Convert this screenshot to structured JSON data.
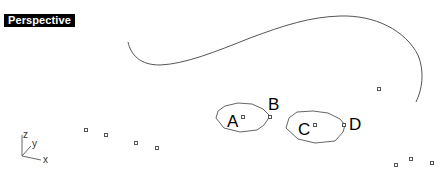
{
  "viewport": {
    "title": "Perspective",
    "axes": {
      "z": "z",
      "y": "y",
      "x": "x"
    },
    "labels": {
      "a": "A",
      "b": "B",
      "c": "C",
      "d": "D"
    },
    "colors": {
      "curve": "#555555",
      "title_bg": "#000000",
      "title_fg": "#ffffff"
    }
  }
}
